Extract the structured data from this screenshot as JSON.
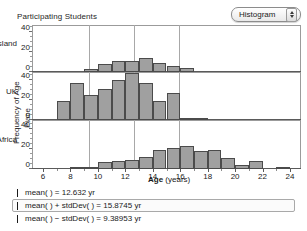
{
  "header": {
    "title": "Participating Students",
    "view_selector": {
      "value": "Histogram",
      "stepper_icon": "stepper-up-down-icon"
    }
  },
  "axes": {
    "ylabel_line1": "Frequency of Age",
    "ylabel_line2": "Place",
    "xlabel": "Age",
    "xlabel_units": "(years)",
    "xticks": [
      6,
      8,
      10,
      12,
      14,
      16,
      18,
      20,
      22,
      24
    ],
    "yticks": [
      0,
      20,
      40
    ],
    "xlim": [
      5.2,
      24.8
    ],
    "ylim": [
      0,
      48
    ]
  },
  "panels": [
    {
      "name": "Queensland"
    },
    {
      "name": "UK"
    },
    {
      "name": "South Africa"
    }
  ],
  "legend": [
    {
      "id": "mean",
      "text": "mean(   ) = 12.632 yr",
      "value": 12.632,
      "selected": false,
      "marker": "vertical-line-marker"
    },
    {
      "id": "mean-plus-sd",
      "text": "mean(   ) + stdDev(   ) = 15.8745 yr",
      "value": 15.8745,
      "selected": true,
      "marker": "vertical-line-marker"
    },
    {
      "id": "mean-minus-sd",
      "text": "mean(   ) − stdDev(   ) = 9.38953 yr",
      "value": 9.38953,
      "selected": false,
      "marker": "vertical-line-marker"
    }
  ],
  "colors": {
    "bar_fill": "#a0a0a0",
    "bar_stroke": "#4b4b4b",
    "frame": "#9b9b9b",
    "refline": "#a8a8a8"
  },
  "chart_data": {
    "type": "bar",
    "title": "Participating Students",
    "xlabel": "Age (years)",
    "ylabel": "Frequency of Age / Place",
    "xlim": [
      5.2,
      24.8
    ],
    "ylim": [
      0,
      48
    ],
    "grid": false,
    "legend_position": "below",
    "bin_width": 1,
    "reference_lines": [
      {
        "label": "mean",
        "value": 12.632
      },
      {
        "label": "mean + stdDev",
        "value": 15.8745
      },
      {
        "label": "mean - stdDev",
        "value": 9.38953
      }
    ],
    "series": [
      {
        "name": "Queensland",
        "bins": [
          9,
          10,
          11,
          12,
          13,
          14,
          15,
          16
        ],
        "values": [
          3,
          8,
          11,
          11,
          14,
          9,
          6,
          4
        ]
      },
      {
        "name": "UK",
        "bins": [
          7,
          8,
          9,
          10,
          11,
          12,
          13,
          14,
          15,
          16,
          17
        ],
        "values": [
          19,
          37,
          25,
          31,
          40,
          47,
          37,
          19,
          27,
          2,
          1
        ]
      },
      {
        "name": "South Africa",
        "bins": [
          8,
          9,
          10,
          11,
          12,
          13,
          14,
          15,
          16,
          17,
          18,
          19,
          20,
          21,
          23
        ],
        "values": [
          1,
          2,
          7,
          8,
          9,
          12,
          19,
          21,
          23,
          18,
          19,
          11,
          4,
          8,
          1
        ]
      }
    ]
  }
}
